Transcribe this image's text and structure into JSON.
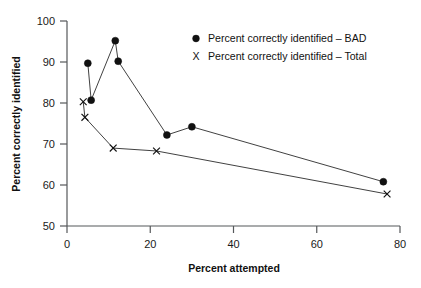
{
  "chart_data": {
    "type": "line",
    "title": "",
    "xlabel": "Percent attempted",
    "ylabel": "Percent correctly identified",
    "xlim": [
      0,
      80
    ],
    "ylim": [
      50,
      100
    ],
    "xticks": [
      0,
      20,
      40,
      60,
      80
    ],
    "yticks": [
      50,
      60,
      70,
      80,
      90,
      100
    ],
    "grid": false,
    "legend_position": "top-right",
    "series": [
      {
        "name": "Percent correctly identified – BAD",
        "marker": "filled-circle",
        "points": [
          {
            "x": 5.0,
            "y": 89.7
          },
          {
            "x": 5.8,
            "y": 80.7
          },
          {
            "x": 11.6,
            "y": 95.2
          },
          {
            "x": 12.3,
            "y": 90.2
          },
          {
            "x": 24.0,
            "y": 72.2
          },
          {
            "x": 30.0,
            "y": 74.2
          },
          {
            "x": 76.0,
            "y": 60.8
          }
        ]
      },
      {
        "name": "Percent correctly identified – Total",
        "marker": "x",
        "points": [
          {
            "x": 3.9,
            "y": 80.3
          },
          {
            "x": 4.3,
            "y": 76.5
          },
          {
            "x": 11.1,
            "y": 69.0
          },
          {
            "x": 21.5,
            "y": 68.3
          },
          {
            "x": 76.9,
            "y": 57.8
          }
        ]
      }
    ]
  },
  "axis": {
    "x_title": "Percent attempted",
    "y_title": "Percent correctly identified",
    "x_tick_labels": [
      "0",
      "20",
      "40",
      "60",
      "80"
    ],
    "y_tick_labels": [
      "50",
      "60",
      "70",
      "80",
      "90",
      "100"
    ]
  },
  "legend": {
    "entries": [
      {
        "glyph": "dot",
        "label": "Percent correctly identified – BAD"
      },
      {
        "glyph": "X",
        "label": "Percent correctly identified – Total"
      }
    ],
    "x_glyph_char": "X"
  },
  "colors": {
    "marker": "#111111",
    "line": "#2b2b2b",
    "axis": "#55585a",
    "background": "#ffffff"
  }
}
